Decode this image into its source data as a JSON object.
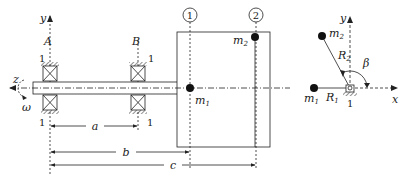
{
  "figure": {
    "left_view": {
      "axes": {
        "y_label": "y",
        "z_label": "z"
      },
      "rotation_label": "ω",
      "bearings": [
        {
          "label": "A",
          "top_number": "1",
          "bottom_number": "1"
        },
        {
          "label": "B",
          "top_number": "1",
          "bottom_number": "1"
        }
      ],
      "planes": [
        {
          "label": "1"
        },
        {
          "label": "2"
        }
      ],
      "masses": [
        {
          "label": "m",
          "sub": "1"
        },
        {
          "label": "m",
          "sub": "2"
        }
      ],
      "dimensions": [
        {
          "label": "a"
        },
        {
          "label": "b"
        },
        {
          "label": "c"
        }
      ]
    },
    "right_view": {
      "axes": {
        "x_label": "x",
        "y_label": "y"
      },
      "masses": [
        {
          "label": "m",
          "sub": "1"
        },
        {
          "label": "m",
          "sub": "2"
        }
      ],
      "radii": [
        {
          "label": "R",
          "sub": "1"
        },
        {
          "label": "R",
          "sub": "2"
        }
      ],
      "angle_label": "β",
      "support_number": "1"
    },
    "colors": {
      "ink": "#222222",
      "hatch": "#555555",
      "shaft_fill": "#ffffff"
    }
  }
}
